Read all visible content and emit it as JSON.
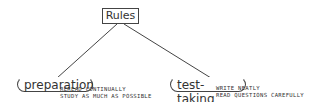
{
  "root": {
    "label": "Rules"
  },
  "children": [
    {
      "label": "preparation",
      "notes": [
        "REREAD CONTINUALLY",
        "STUDY AS MUCH AS POSSIBLE"
      ]
    },
    {
      "label": "test-taking",
      "notes": [
        "WRITE NEATLY",
        "READ QUESTIONS CAREFULLY"
      ]
    }
  ],
  "colors": {
    "stroke": "#444444",
    "text": "#333333",
    "background": "#ffffff"
  }
}
